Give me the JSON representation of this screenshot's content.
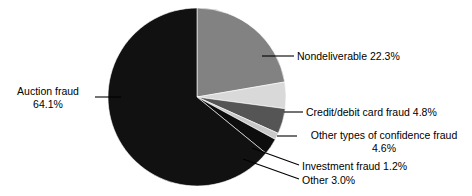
{
  "chart_data": {
    "type": "pie",
    "title": "",
    "subtitle": "",
    "xlabel": "",
    "ylabel": "",
    "legend_position": "none",
    "grid": false,
    "labels_outside": true,
    "units": "percent",
    "categories": [
      "Nondeliverable",
      "Credit/debit card fraud",
      "Other types of confidence fraud",
      "Investment fraud",
      "Other",
      "Auction fraud"
    ],
    "values": [
      22.3,
      4.8,
      4.6,
      1.2,
      3.0,
      64.1
    ],
    "colors": [
      "#828282",
      "#d9d9d9",
      "#555555",
      "#c9c9c9",
      "#0d0d0d",
      "#111111"
    ],
    "start_angle_deg": 0,
    "direction": "clockwise",
    "slices": [
      {
        "name": "Nondeliverable",
        "value": 22.3,
        "value_text": "22.3%",
        "color": "#828282"
      },
      {
        "name": "Credit/debit card fraud",
        "value": 4.8,
        "value_text": "4.8%",
        "color": "#d9d9d9"
      },
      {
        "name": "Other types of confidence fraud",
        "value": 4.6,
        "value_text": "4.6%",
        "color": "#555555"
      },
      {
        "name": "Investment fraud",
        "value": 1.2,
        "value_text": "1.2%",
        "color": "#c9c9c9"
      },
      {
        "name": "Other",
        "value": 3.0,
        "value_text": "3.0%",
        "color": "#0d0d0d"
      },
      {
        "name": "Auction fraud",
        "value": 64.1,
        "value_text": "64.1%",
        "color": "#111111"
      }
    ]
  },
  "labels": {
    "auction_line1": "Auction fraud",
    "auction_line2": "64.1%",
    "nondeliverable": "Nondeliverable 22.3%",
    "credit": "Credit/debit card fraud 4.8%",
    "confidence_line1": "Other types of confidence fraud",
    "confidence_line2": "4.6%",
    "investment": "Investment fraud 1.2%",
    "other": "Other 3.0%"
  },
  "colors": {
    "background": "#ffffff",
    "text": "#000000",
    "leader_line": "#000000"
  }
}
